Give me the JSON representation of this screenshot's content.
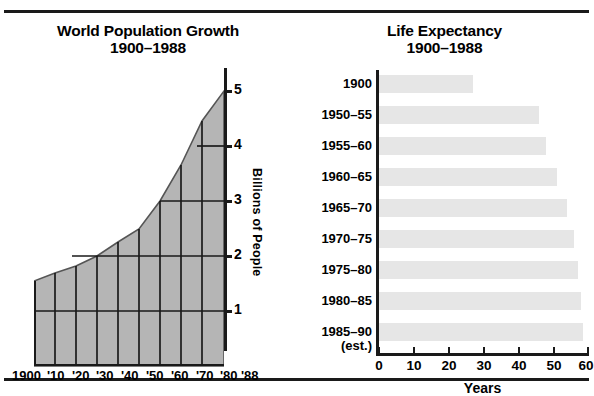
{
  "population_chart": {
    "title_line1": "World Population Growth",
    "title_line2": "1900–1988",
    "yaxis_title": "Billions of People",
    "ytick_labels": [
      "5",
      "4",
      "3",
      "2",
      "1"
    ],
    "xtick_labels": [
      "1900",
      "'10",
      "'20",
      "'30",
      "'40",
      "'50",
      "'60",
      "'70",
      "'80",
      "'88"
    ],
    "fill_color": "#b5b5b5",
    "grid_color": "#1a1a1a"
  },
  "life_chart": {
    "title_line1": "Life Expectancy",
    "title_line2": "1900–1988",
    "xaxis_title": "Years",
    "xtick_labels": [
      "0",
      "10",
      "20",
      "30",
      "40",
      "50",
      "60"
    ],
    "bar_color": "#e6e6e6",
    "rows": [
      {
        "label": "1900",
        "sub": "",
        "value": 27
      },
      {
        "label": "1950–55",
        "sub": "",
        "value": 46
      },
      {
        "label": "1955–60",
        "sub": "",
        "value": 48
      },
      {
        "label": "1960–65",
        "sub": "",
        "value": 51
      },
      {
        "label": "1965–70",
        "sub": "",
        "value": 54
      },
      {
        "label": "1970–75",
        "sub": "",
        "value": 56
      },
      {
        "label": "1975–80",
        "sub": "",
        "value": 57
      },
      {
        "label": "1980–85",
        "sub": "",
        "value": 58
      },
      {
        "label": "1985–90",
        "sub": "(est.)",
        "value": 58.5
      }
    ]
  },
  "chart_data": [
    {
      "type": "area",
      "title": "World Population Growth 1900–1988",
      "xlabel": "",
      "ylabel": "Billions of People",
      "x": [
        "1900",
        "1910",
        "1920",
        "1930",
        "1940",
        "1950",
        "1960",
        "1970",
        "1980",
        "1988"
      ],
      "xtick_labels": [
        "1900",
        "'10",
        "'20",
        "'30",
        "'40",
        "'50",
        "'60",
        "'70",
        "'80",
        "'88"
      ],
      "values": [
        1.55,
        1.7,
        1.82,
        2.0,
        2.25,
        2.5,
        3.0,
        3.65,
        4.45,
        5.0
      ],
      "ylim": [
        0,
        5
      ],
      "yticks": [
        1,
        2,
        3,
        4,
        5
      ],
      "grid": true,
      "legend": "none"
    },
    {
      "type": "bar",
      "orientation": "horizontal",
      "title": "Life Expectancy 1900–1988",
      "xlabel": "Years",
      "ylabel": "",
      "categories": [
        "1900",
        "1950–55",
        "1955–60",
        "1960–65",
        "1965–70",
        "1970–75",
        "1975–80",
        "1980–85",
        "1985–90 (est.)"
      ],
      "values": [
        27,
        46,
        48,
        51,
        54,
        56,
        57,
        58,
        58.5
      ],
      "xlim": [
        0,
        60
      ],
      "xticks": [
        0,
        10,
        20,
        30,
        40,
        50,
        60
      ],
      "grid": false,
      "legend": "none"
    }
  ]
}
